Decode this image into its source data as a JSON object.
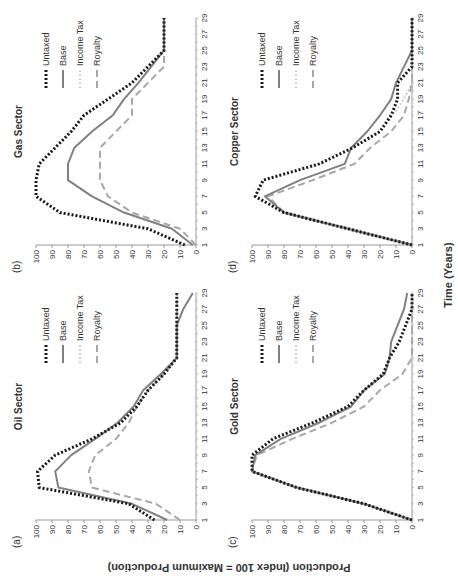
{
  "figure": {
    "ylabel": "Production (Index 100 = Maximum Production)",
    "xlabel": "Time (Years)",
    "legend": [
      "Untaxed",
      "Base",
      "Income Tax",
      "Royalty"
    ],
    "styles": {
      "Untaxed": {
        "color": "#1a1a1a",
        "dash": "2,2",
        "width": 3
      },
      "Base": {
        "color": "#808080",
        "dash": "",
        "width": 2
      },
      "Income Tax": {
        "color": "#b5b5b5",
        "dash": "1.5,2.5",
        "width": 1.5
      },
      "Royalty": {
        "color": "#a8a8a8",
        "dash": "7,4",
        "width": 2
      }
    }
  },
  "chart_data": [
    {
      "panel": "(a)",
      "title": "Oil Sector",
      "type": "line",
      "x": [
        1,
        3,
        5,
        7,
        9,
        11,
        13,
        15,
        17,
        19,
        21,
        23,
        25,
        27,
        29
      ],
      "xticks": [
        1,
        3,
        5,
        7,
        9,
        11,
        13,
        15,
        17,
        19,
        21,
        23,
        25,
        27,
        29
      ],
      "yticks": [
        0,
        10,
        20,
        30,
        40,
        50,
        60,
        70,
        80,
        90,
        100
      ],
      "ylim": [
        0,
        100
      ],
      "series": [
        {
          "name": "Untaxed",
          "values": [
            26,
            42,
            98,
            99,
            88,
            65,
            47,
            37,
            30,
            20,
            12,
            12,
            12,
            12,
            12
          ]
        },
        {
          "name": "Base",
          "values": [
            18,
            40,
            86,
            88,
            78,
            63,
            49,
            39,
            33,
            22,
            12,
            12,
            12,
            8,
            2
          ]
        },
        {
          "name": "Income Tax",
          "values": [
            26,
            42,
            98,
            99,
            88,
            65,
            47,
            37,
            30,
            20,
            12,
            12,
            12,
            12,
            12
          ]
        },
        {
          "name": "Royalty",
          "values": [
            10,
            25,
            65,
            67,
            63,
            50,
            42,
            37,
            30,
            20,
            12,
            12,
            12,
            12,
            12
          ]
        }
      ]
    },
    {
      "panel": "(b)",
      "title": "Gas Sector",
      "type": "line",
      "x": [
        1,
        3,
        5,
        7,
        9,
        11,
        13,
        15,
        17,
        19,
        21,
        23,
        25,
        27,
        29
      ],
      "xticks": [
        1,
        3,
        5,
        7,
        9,
        11,
        13,
        15,
        17,
        19,
        21,
        23,
        25,
        27,
        29
      ],
      "yticks": [
        0,
        10,
        20,
        30,
        40,
        50,
        60,
        70,
        80,
        90,
        100
      ],
      "ylim": [
        0,
        100
      ],
      "series": [
        {
          "name": "Untaxed",
          "values": [
            7,
            30,
            85,
            100,
            100,
            98,
            88,
            78,
            70,
            55,
            40,
            30,
            20,
            20,
            20
          ]
        },
        {
          "name": "Base",
          "values": [
            2,
            15,
            45,
            65,
            80,
            80,
            76,
            65,
            52,
            45,
            36,
            28,
            20,
            20,
            20
          ]
        },
        {
          "name": "Income Tax",
          "values": [
            7,
            30,
            85,
            100,
            100,
            98,
            88,
            78,
            70,
            55,
            40,
            30,
            20,
            20,
            20
          ]
        },
        {
          "name": "Royalty",
          "values": [
            0,
            10,
            40,
            55,
            60,
            60,
            60,
            50,
            40,
            40,
            30,
            20,
            20,
            20,
            20
          ]
        }
      ]
    },
    {
      "panel": "(c)",
      "title": "Gold Sector",
      "type": "line",
      "x": [
        1,
        3,
        5,
        7,
        9,
        11,
        13,
        15,
        17,
        19,
        21,
        23,
        25,
        27,
        29
      ],
      "xticks": [
        1,
        3,
        5,
        7,
        9,
        11,
        13,
        15,
        17,
        19,
        21,
        23,
        25,
        27,
        29
      ],
      "yticks": [
        0,
        10,
        20,
        30,
        40,
        50,
        60,
        70,
        80,
        90,
        100
      ],
      "ylim": [
        0,
        100
      ],
      "series": [
        {
          "name": "Untaxed",
          "values": [
            0,
            30,
            72,
            100,
            100,
            87,
            62,
            40,
            30,
            18,
            14,
            8,
            4,
            0,
            0
          ]
        },
        {
          "name": "Base",
          "values": [
            0,
            30,
            72,
            100,
            98,
            82,
            58,
            38,
            30,
            17,
            14,
            13,
            9,
            5,
            3
          ]
        },
        {
          "name": "Income Tax",
          "values": [
            0,
            30,
            72,
            100,
            100,
            87,
            62,
            40,
            30,
            18,
            14,
            8,
            4,
            0,
            0
          ]
        },
        {
          "name": "Royalty",
          "values": [
            0,
            30,
            72,
            100,
            97,
            75,
            50,
            30,
            20,
            6,
            0,
            0,
            0,
            0,
            0
          ]
        }
      ]
    },
    {
      "panel": "(d)",
      "title": "Copper Sector",
      "type": "line",
      "x": [
        1,
        3,
        5,
        7,
        9,
        11,
        13,
        15,
        17,
        19,
        21,
        23,
        25,
        27,
        29
      ],
      "xticks": [
        1,
        3,
        5,
        7,
        9,
        11,
        13,
        15,
        17,
        19,
        21,
        23,
        25,
        27,
        29
      ],
      "yticks": [
        0,
        10,
        20,
        30,
        40,
        50,
        60,
        70,
        80,
        90,
        100
      ],
      "ylim": [
        0,
        100
      ],
      "series": [
        {
          "name": "Untaxed",
          "values": [
            0,
            40,
            80,
            98,
            93,
            58,
            37,
            20,
            13,
            9,
            9,
            0,
            0,
            0,
            0
          ]
        },
        {
          "name": "Base",
          "values": [
            0,
            40,
            80,
            92,
            70,
            42,
            38,
            28,
            20,
            13,
            10,
            5,
            0,
            0,
            0
          ]
        },
        {
          "name": "Income Tax",
          "values": [
            0,
            40,
            80,
            98,
            93,
            58,
            37,
            20,
            12,
            5,
            0,
            0,
            0,
            0,
            0
          ]
        },
        {
          "name": "Royalty",
          "values": [
            0,
            40,
            80,
            90,
            62,
            36,
            26,
            13,
            5,
            2,
            0,
            0,
            0,
            0,
            0
          ]
        }
      ]
    }
  ]
}
